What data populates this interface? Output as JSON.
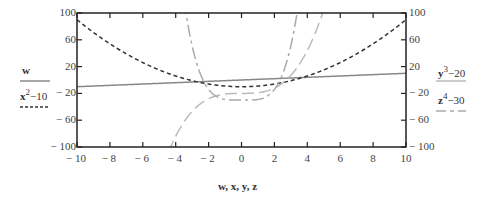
{
  "chart_data": {
    "type": "line",
    "title": "",
    "xlabel": "w, x, y, z",
    "ylabel_left": [
      "w",
      "x^2-10"
    ],
    "ylabel_right": [
      "y^3-20",
      "z^4-30"
    ],
    "xlim": [
      -10,
      10
    ],
    "ylim": [
      -100,
      100
    ],
    "x_ticks": [
      "-10",
      "-8",
      "-6",
      "-4",
      "-2",
      "0",
      "2",
      "4",
      "6",
      "8",
      "10"
    ],
    "y_ticks_left": [
      "100",
      "60",
      "20",
      "-20",
      "-60",
      "-100"
    ],
    "y_ticks_right": [
      "100",
      "60",
      "20",
      "-20",
      "-60",
      "-100"
    ],
    "grid": false,
    "series": [
      {
        "name": "w",
        "expression": "w",
        "style": "solid",
        "color": "#888888",
        "x": [
          -10,
          10
        ],
        "values": [
          -10,
          10
        ]
      },
      {
        "name": "x^2-10",
        "expression": "x^2 - 10",
        "style": "dashed",
        "color": "#333333",
        "x": [
          -10,
          -8,
          -6,
          -4,
          -2,
          0,
          2,
          4,
          6,
          8,
          10
        ],
        "values": [
          90,
          54,
          26,
          6,
          -6,
          -10,
          -6,
          6,
          26,
          54,
          90
        ]
      },
      {
        "name": "y^3-20",
        "expression": "y^3 - 20",
        "style": "long-dash",
        "color": "#bbbbbb",
        "x": [
          -4.24,
          -4,
          -3,
          -2,
          -1,
          0,
          1,
          2,
          3,
          4,
          4.93
        ],
        "values": [
          -100,
          -84,
          -47,
          -28,
          -21,
          -20,
          -19,
          -12,
          7,
          44,
          100
        ]
      },
      {
        "name": "z^4-30",
        "expression": "z^4 - 30",
        "style": "dash-dot",
        "color": "#aaaaaa",
        "x": [
          -3.59,
          -3,
          -2,
          -1,
          0,
          1,
          2,
          3,
          3.59
        ],
        "values": [
          100,
          51,
          -14,
          -29,
          -30,
          -29,
          -14,
          51,
          100
        ]
      }
    ]
  },
  "axes": {
    "x_label": "w, x, y, z",
    "left_ticks": [
      "100",
      "60",
      "20",
      "− 20",
      "− 60",
      "− 100"
    ],
    "right_ticks": [
      "100",
      "60",
      "20",
      "− 20",
      "− 60",
      "− 100"
    ],
    "x_ticks": [
      "− 10",
      "− 8",
      "− 6",
      "− 4",
      "− 2",
      "0",
      "2",
      "4",
      "6",
      "8",
      "10"
    ]
  },
  "legend": {
    "left": [
      {
        "base": "w",
        "sup": "",
        "rest": ""
      },
      {
        "base": "x",
        "sup": "2",
        "rest": "−10"
      }
    ],
    "right": [
      {
        "base": "y",
        "sup": "3",
        "rest": "−20"
      },
      {
        "base": "z",
        "sup": "4",
        "rest": "−30"
      }
    ]
  }
}
